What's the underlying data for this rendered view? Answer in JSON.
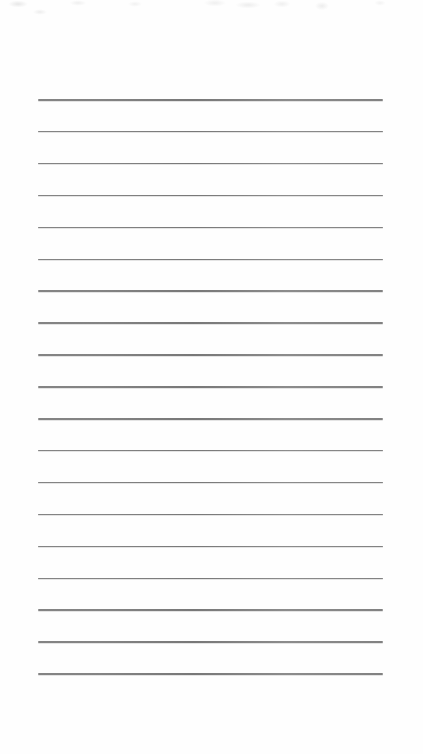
{
  "page": {
    "type": "blank-ruled-notepaper",
    "background_color": "#fefefe",
    "content_text": ""
  },
  "ruled_lines": {
    "count": 19,
    "color": "#767676",
    "first_y": 99,
    "spacing": 31.9,
    "left": 38,
    "width": 345,
    "thickness": 1.6
  }
}
